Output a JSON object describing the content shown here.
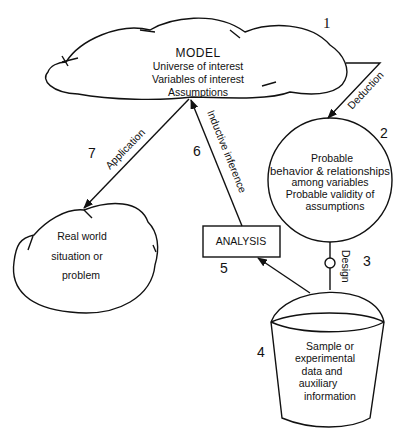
{
  "diagram": {
    "model": {
      "number": "1",
      "title": "MODEL",
      "lines": [
        "Universe of interest",
        "Variables of interest",
        "Assumptions"
      ]
    },
    "deduction": {
      "number": "2",
      "arrow_label": "Deduction",
      "lines": [
        "Probable",
        "behavior & relationships",
        "among variables",
        "Probable validity of",
        "assumptions"
      ]
    },
    "design": {
      "number": "3",
      "label": "Design"
    },
    "sample": {
      "number": "4",
      "lines": [
        "Sample or",
        "experimental",
        "data and",
        "auxiliary",
        "information"
      ]
    },
    "analysis": {
      "number": "5",
      "label": "ANALYSIS"
    },
    "inductive": {
      "number": "6",
      "label": "Inductive inference"
    },
    "application": {
      "number": "7",
      "label": "Application"
    },
    "real_world": {
      "lines": [
        "Real world",
        "situation or",
        "problem"
      ]
    },
    "colors": {
      "ink": "#111111",
      "background": "#ffffff"
    }
  }
}
